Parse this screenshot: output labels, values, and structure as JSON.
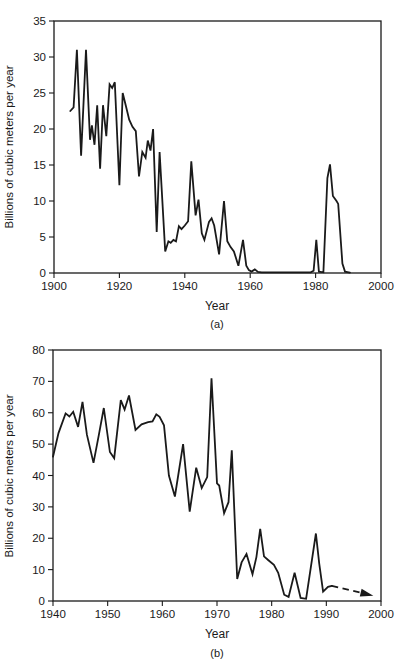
{
  "page": {
    "background": "#ffffff",
    "line_color": "#1a1a1a",
    "axis_color": "#1a1a1a"
  },
  "chart_data": [
    {
      "type": "line",
      "title": "",
      "caption": "(a)",
      "xlabel": "Year",
      "ylabel": "Billions of cubic meters per year",
      "xlim": [
        1900,
        2000
      ],
      "ylim": [
        0,
        35
      ],
      "xticks": [
        1900,
        1920,
        1940,
        1960,
        1980,
        2000
      ],
      "yticks": [
        0,
        5,
        10,
        15,
        20,
        25,
        30,
        35
      ],
      "grid": false,
      "frame": "box",
      "legend": "none",
      "line_color": "#1a1a1a",
      "series": [
        {
          "name": "annual volume",
          "points": [
            [
              1905,
              22.5
            ],
            [
              1906,
              23
            ],
            [
              1907,
              31
            ],
            [
              1908.3,
              16.3
            ],
            [
              1909.8,
              31
            ],
            [
              1911,
              18.5
            ],
            [
              1911.6,
              20.5
            ],
            [
              1912.4,
              17.8
            ],
            [
              1913.2,
              23.3
            ],
            [
              1914.1,
              14.5
            ],
            [
              1915,
              23.3
            ],
            [
              1916,
              19
            ],
            [
              1917,
              26.2
            ],
            [
              1917.8,
              25.7
            ],
            [
              1918.6,
              26.5
            ],
            [
              1920,
              12.2
            ],
            [
              1921,
              25
            ],
            [
              1922,
              23.2
            ],
            [
              1923,
              21.3
            ],
            [
              1924,
              20.3
            ],
            [
              1925,
              19.7
            ],
            [
              1926,
              13.4
            ],
            [
              1927,
              16.8
            ],
            [
              1928,
              16
            ],
            [
              1928.7,
              18.4
            ],
            [
              1929.5,
              17
            ],
            [
              1930.3,
              20
            ],
            [
              1931.4,
              5.7
            ],
            [
              1932.3,
              16.8
            ],
            [
              1934,
              3
            ],
            [
              1935,
              4.4
            ],
            [
              1935.7,
              4.2
            ],
            [
              1936.5,
              4.6
            ],
            [
              1937.3,
              4.4
            ],
            [
              1938.2,
              6.5
            ],
            [
              1939,
              6.1
            ],
            [
              1940,
              6.6
            ],
            [
              1941,
              7.2
            ],
            [
              1942,
              15.5
            ],
            [
              1943.3,
              8
            ],
            [
              1944.2,
              10.2
            ],
            [
              1945.2,
              5.5
            ],
            [
              1946,
              4.6
            ],
            [
              1947.4,
              7.1
            ],
            [
              1948.2,
              7.6
            ],
            [
              1949,
              6.6
            ],
            [
              1950.5,
              2.6
            ],
            [
              1952,
              10
            ],
            [
              1953,
              4.4
            ],
            [
              1954,
              3.6
            ],
            [
              1955,
              3
            ],
            [
              1956.4,
              1
            ],
            [
              1957.8,
              4.6
            ],
            [
              1958.8,
              1
            ],
            [
              1959.6,
              0.4
            ],
            [
              1960.4,
              0.2
            ],
            [
              1961.4,
              0.5
            ],
            [
              1962.4,
              0.15
            ],
            [
              1963.5,
              0.1
            ],
            [
              1978.5,
              0.1
            ],
            [
              1979.4,
              0.3
            ],
            [
              1980.2,
              4.6
            ],
            [
              1981,
              0.2
            ],
            [
              1982.4,
              0.1
            ],
            [
              1983.6,
              13.2
            ],
            [
              1984.4,
              15.1
            ],
            [
              1985.3,
              10.7
            ],
            [
              1986.4,
              10
            ],
            [
              1986.9,
              9.6
            ],
            [
              1988.2,
              1.3
            ],
            [
              1989,
              0.2
            ],
            [
              1990.5,
              0.05
            ]
          ]
        }
      ]
    },
    {
      "type": "line",
      "title": "",
      "caption": "(b)",
      "xlabel": "Year",
      "ylabel": "Billions of cubic meters per year",
      "xlim": [
        1940,
        2000
      ],
      "ylim": [
        0,
        80
      ],
      "xticks": [
        1940,
        1950,
        1960,
        1970,
        1980,
        1990,
        2000
      ],
      "yticks": [
        0,
        10,
        20,
        30,
        40,
        50,
        60,
        70,
        80
      ],
      "grid": false,
      "frame": "box",
      "legend": "none",
      "line_color": "#1a1a1a",
      "series": [
        {
          "name": "annual volume",
          "points": [
            [
              1940,
              46
            ],
            [
              1941,
              53.5
            ],
            [
              1942.3,
              59.8
            ],
            [
              1943,
              58.8
            ],
            [
              1943.7,
              60.3
            ],
            [
              1944.6,
              55.5
            ],
            [
              1945.4,
              63.5
            ],
            [
              1946.2,
              53
            ],
            [
              1947.4,
              44
            ],
            [
              1948.4,
              53
            ],
            [
              1949.3,
              61.5
            ],
            [
              1950.4,
              47.5
            ],
            [
              1951.2,
              45.5
            ],
            [
              1952.4,
              64
            ],
            [
              1953.1,
              61
            ],
            [
              1953.9,
              65.5
            ],
            [
              1955.1,
              54.5
            ],
            [
              1956.2,
              56.3
            ],
            [
              1957.4,
              57
            ],
            [
              1958.2,
              57.2
            ],
            [
              1958.9,
              59.5
            ],
            [
              1959.5,
              58.7
            ],
            [
              1960.3,
              56
            ],
            [
              1961.2,
              40
            ],
            [
              1962.3,
              33.3
            ],
            [
              1963.8,
              50
            ],
            [
              1965,
              28.5
            ],
            [
              1966.2,
              42.5
            ],
            [
              1967.2,
              36
            ],
            [
              1968.2,
              39.5
            ],
            [
              1969,
              71
            ],
            [
              1970,
              37.5
            ],
            [
              1970.4,
              36.8
            ],
            [
              1971.3,
              28
            ],
            [
              1972.1,
              31.5
            ],
            [
              1972.7,
              48
            ],
            [
              1973.7,
              7
            ],
            [
              1974.5,
              12.3
            ],
            [
              1975.4,
              15
            ],
            [
              1976.5,
              8.5
            ],
            [
              1977.2,
              14
            ],
            [
              1977.9,
              23
            ],
            [
              1978.6,
              14.2
            ],
            [
              1979.4,
              13
            ],
            [
              1980.4,
              11.5
            ],
            [
              1981.2,
              9
            ],
            [
              1982.3,
              2
            ],
            [
              1983.1,
              1.3
            ],
            [
              1984.2,
              9
            ],
            [
              1985.3,
              1
            ],
            [
              1986.3,
              0.7
            ],
            [
              1988.1,
              21.5
            ],
            [
              1988.7,
              12
            ],
            [
              1989.4,
              3
            ],
            [
              1990.3,
              4.5
            ],
            [
              1991,
              4.8
            ]
          ]
        }
      ],
      "annotation": {
        "type": "dashed_arrow",
        "from": [
          1991,
          4.8
        ],
        "to": [
          1998.6,
          1.7
        ]
      }
    }
  ]
}
